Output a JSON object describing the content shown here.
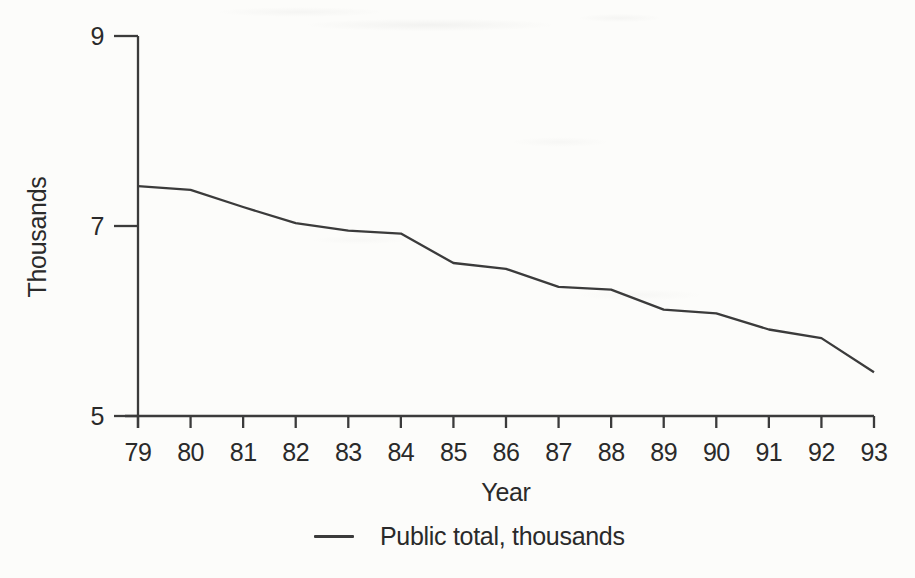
{
  "page": {
    "background": "#fcfcfa",
    "ink_color": "#2a2a2a",
    "line_color": "#3b3b3b"
  },
  "chart_data": {
    "type": "line",
    "title": "",
    "xlabel": "Year",
    "ylabel": "Thousands",
    "x": [
      "79",
      "80",
      "81",
      "82",
      "83",
      "84",
      "85",
      "86",
      "87",
      "88",
      "89",
      "90",
      "91",
      "92",
      "93"
    ],
    "series": [
      {
        "name": "Public total, thousands",
        "values": [
          7.42,
          7.38,
          7.2,
          7.03,
          6.95,
          6.92,
          6.61,
          6.55,
          6.36,
          6.33,
          6.12,
          6.08,
          5.91,
          5.82,
          5.46
        ]
      }
    ],
    "ylim": [
      5,
      9
    ],
    "yticks": [
      9,
      7,
      5
    ],
    "xlim_years": [
      79,
      93
    ],
    "grid": false,
    "legend_position": "bottom-center",
    "legend_swatch": "line"
  }
}
